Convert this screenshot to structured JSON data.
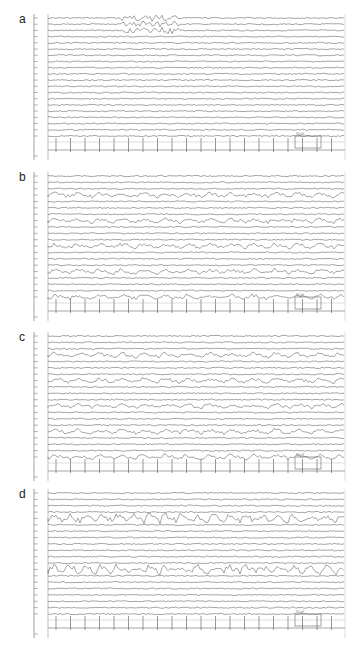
{
  "figure": {
    "panels": [
      {
        "label": "a",
        "top": 12,
        "height": 152,
        "channels": 20,
        "calibration_label": "50 µV"
      },
      {
        "label": "b",
        "top": 170,
        "height": 155,
        "channels": 20,
        "calibration_label": "50 µV"
      },
      {
        "label": "c",
        "top": 330,
        "height": 155,
        "channels": 20,
        "calibration_label": "50 µV"
      },
      {
        "label": "d",
        "top": 487,
        "height": 155,
        "channels": 20,
        "calibration_label": "50 µV"
      }
    ],
    "trace_color": "#6a6a6a",
    "axis_color": "#888888"
  }
}
